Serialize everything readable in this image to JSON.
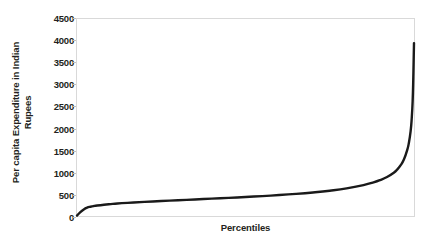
{
  "chart_data": {
    "type": "line",
    "title": "",
    "xlabel": "Percentiles",
    "ylabel": "Per capita Expenditure in Indian Rupees",
    "ylabel_line1": "Per capita Expenditure in Indian",
    "ylabel_line2": "Rupees",
    "xlim": [
      0,
      100
    ],
    "ylim": [
      0,
      4500
    ],
    "ytick_labels": [
      "0",
      "500",
      "1000",
      "1500",
      "2000",
      "2500",
      "3000",
      "3500",
      "4000",
      "4500"
    ],
    "ytick_values": [
      0,
      500,
      1000,
      1500,
      2000,
      2500,
      3000,
      3500,
      4000,
      4500
    ],
    "xtick_labels": [],
    "grid": false,
    "legend": false,
    "series": [
      {
        "name": "Per capita expenditure",
        "color": "#1a1a1a",
        "line_width": 2.4,
        "x": [
          0,
          1,
          2,
          3,
          4,
          5,
          6,
          8,
          10,
          12,
          15,
          20,
          25,
          30,
          35,
          40,
          45,
          50,
          55,
          60,
          65,
          70,
          75,
          80,
          85,
          88,
          90,
          92,
          94,
          95,
          96,
          97,
          98,
          98.5,
          99,
          99.3,
          99.6,
          99.8,
          100
        ],
        "y": [
          10,
          90,
          150,
          190,
          212,
          228,
          240,
          258,
          272,
          285,
          300,
          322,
          342,
          360,
          378,
          396,
          414,
          434,
          455,
          478,
          505,
          538,
          578,
          630,
          706,
          768,
          822,
          892,
          990,
          1060,
          1155,
          1290,
          1510,
          1680,
          1940,
          2200,
          2620,
          3180,
          3950
        ]
      }
    ]
  }
}
